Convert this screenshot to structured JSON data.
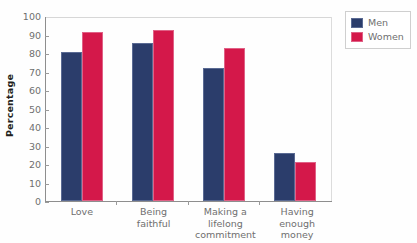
{
  "chart_data": {
    "type": "bar",
    "title": "",
    "xlabel": "",
    "ylabel": "Percentage",
    "ylim": [
      0,
      100
    ],
    "yticks": [
      0,
      10,
      20,
      30,
      40,
      50,
      60,
      70,
      80,
      90,
      100
    ],
    "grid": false,
    "legend_position": "right",
    "categories": [
      "Love",
      "Being\nfaithful",
      "Making a\nlifelong\ncommitment",
      "Having\nenough\nmoney"
    ],
    "series": [
      {
        "name": "Men",
        "color": "#2B3D6B",
        "values": [
          81,
          86,
          72,
          26
        ]
      },
      {
        "name": "Women",
        "color": "#D4184A",
        "values": [
          92,
          93,
          83,
          21
        ]
      }
    ]
  },
  "axis": {
    "y_title": "Percentage",
    "y_tick_labels": [
      "100",
      "90",
      "80",
      "70",
      "60",
      "50",
      "40",
      "30",
      "20",
      "10",
      "0"
    ],
    "x_tick_labels": [
      [
        "Love"
      ],
      [
        "Being",
        "faithful"
      ],
      [
        "Making a",
        "lifelong",
        "commitment"
      ],
      [
        "Having",
        "enough",
        "money"
      ]
    ]
  },
  "legend": {
    "entries": [
      {
        "label": "Men",
        "color": "#2B3D6B"
      },
      {
        "label": "Women",
        "color": "#D4184A"
      }
    ]
  }
}
